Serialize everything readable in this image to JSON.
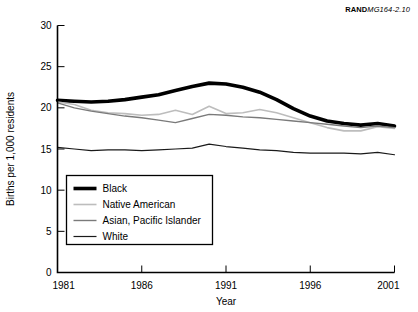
{
  "figure": {
    "source_note_brand": "RAND",
    "source_note_id": "MG164-2.10"
  },
  "chart_data": {
    "type": "line",
    "title": "",
    "subtitle": "",
    "xlabel": "Year",
    "ylabel": "Births per 1,000 residents",
    "xlim": [
      1981,
      2001
    ],
    "ylim": [
      0,
      30
    ],
    "xticks": [
      1981,
      1986,
      1991,
      1996,
      2001
    ],
    "xtick_labels": [
      "1981",
      "1986",
      "1991",
      "1996",
      "2001"
    ],
    "yticks": [
      0,
      5,
      10,
      15,
      20,
      25,
      30
    ],
    "ytick_labels": [
      "0",
      "5",
      "10",
      "15",
      "20",
      "25",
      "30"
    ],
    "grid": false,
    "legend_position": "lower left",
    "x": [
      1981,
      1982,
      1983,
      1984,
      1985,
      1986,
      1987,
      1988,
      1989,
      1990,
      1991,
      1992,
      1993,
      1994,
      1995,
      1996,
      1997,
      1998,
      1999,
      2000,
      2001
    ],
    "series": [
      {
        "name": "Black",
        "color": "#000000",
        "width": 3.6,
        "values": [
          20.9,
          20.8,
          20.7,
          20.8,
          21.0,
          21.3,
          21.6,
          22.1,
          22.6,
          23.0,
          22.9,
          22.5,
          21.9,
          21.0,
          19.9,
          19.0,
          18.4,
          18.1,
          17.9,
          18.1,
          17.8
        ]
      },
      {
        "name": "Native American",
        "color": "#bdbdbd",
        "width": 1.6,
        "values": [
          20.7,
          20.4,
          19.7,
          19.4,
          19.3,
          19.1,
          19.2,
          19.7,
          19.2,
          20.2,
          19.3,
          19.4,
          19.8,
          19.4,
          18.8,
          18.2,
          17.6,
          17.2,
          17.2,
          17.7,
          17.5
        ]
      },
      {
        "name": "Asian, Pacific Islander",
        "color": "#7a7a7a",
        "width": 1.4,
        "values": [
          20.6,
          20.0,
          19.6,
          19.3,
          19.0,
          18.8,
          18.5,
          18.2,
          18.7,
          19.2,
          19.1,
          18.9,
          18.8,
          18.6,
          18.4,
          18.2,
          18.0,
          17.8,
          17.6,
          17.8,
          17.6
        ]
      },
      {
        "name": "White",
        "color": "#1a1a1a",
        "width": 1.2,
        "values": [
          15.2,
          15.0,
          14.8,
          14.9,
          14.9,
          14.8,
          14.9,
          15.0,
          15.1,
          15.6,
          15.3,
          15.1,
          14.9,
          14.8,
          14.6,
          14.5,
          14.5,
          14.5,
          14.4,
          14.6,
          14.3
        ]
      }
    ]
  }
}
